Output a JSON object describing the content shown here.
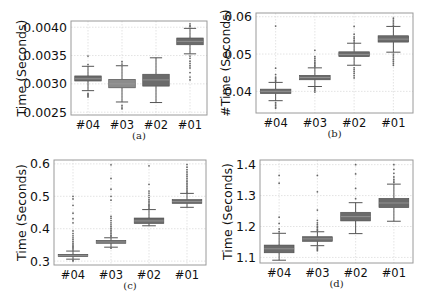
{
  "figure": {
    "panels": [
      {
        "id": "a",
        "caption": "(a)"
      },
      {
        "id": "b",
        "caption": "(b)"
      },
      {
        "id": "c",
        "caption": "(c)"
      },
      {
        "id": "d",
        "caption": "(d)"
      }
    ]
  },
  "colors": {
    "box_fill": "#6b6b6b",
    "box_fill_light": "#8c8c8c",
    "box_edge": "#4a4a4a",
    "median": "#9a9a9a",
    "whisker": "#555555",
    "flier": "#666666",
    "grid": "#dcdcdc",
    "frame": "#9a9a9a"
  },
  "chart_data": [
    {
      "type": "box",
      "panel": "a",
      "caption": "(a)",
      "title": "",
      "xlabel": "",
      "ylabel": "Time (Seconds)",
      "categories": [
        "#04",
        "#03",
        "#02",
        "#01"
      ],
      "ylim": [
        0.00245,
        0.00411
      ],
      "yticks": [
        0.0025,
        0.003,
        0.0035,
        0.004
      ],
      "ytick_labels": [
        "0.0025",
        "0.0030",
        "0.0035",
        "0.0040"
      ],
      "grid": true,
      "boxes": [
        {
          "label": "#04",
          "whislo": 0.00288,
          "q1": 0.00305,
          "med": 0.00309,
          "q3": 0.00314,
          "whishi": 0.00331,
          "fliers": [
            0.00277,
            0.00279,
            0.00281,
            0.00283,
            0.00334,
            0.00349
          ],
          "light": false
        },
        {
          "label": "#03",
          "whislo": 0.00268,
          "q1": 0.00293,
          "med": 0.003,
          "q3": 0.00308,
          "whishi": 0.00332,
          "fliers": [
            0.00256,
            0.00259,
            0.00262,
            0.00335,
            0.00339
          ],
          "light": true
        },
        {
          "label": "#02",
          "whislo": 0.00267,
          "q1": 0.00296,
          "med": 0.00307,
          "q3": 0.00317,
          "whishi": 0.00346,
          "fliers": [],
          "light": false
        },
        {
          "label": "#01",
          "whislo": 0.00353,
          "q1": 0.00369,
          "med": 0.00375,
          "q3": 0.00381,
          "whishi": 0.00398,
          "fliers": [
            0.00307,
            0.00312,
            0.0032,
            0.00328,
            0.00332,
            0.00336,
            0.0034,
            0.00345,
            0.00349,
            0.00401,
            0.00403,
            0.00406
          ],
          "light": false
        }
      ]
    },
    {
      "type": "box",
      "panel": "b",
      "caption": "(b)",
      "title": "",
      "xlabel": "",
      "ylabel": "#Time (Seconds)",
      "categories": [
        "#04",
        "#03",
        "#02",
        "#01"
      ],
      "ylim": [
        0.0342,
        0.061
      ],
      "yticks": [
        0.04,
        0.05,
        0.06
      ],
      "ytick_labels": [
        "0.04",
        "0.05",
        "0.06"
      ],
      "grid": true,
      "boxes": [
        {
          "label": "#04",
          "whislo": 0.0375,
          "q1": 0.0394,
          "med": 0.04,
          "q3": 0.0406,
          "whishi": 0.0424,
          "fliers": [
            0.0355,
            0.0358,
            0.0362,
            0.0366,
            0.037,
            0.0427,
            0.043,
            0.0434,
            0.0438,
            0.0445,
            0.0462,
            0.0575
          ],
          "light": false
        },
        {
          "label": "#03",
          "whislo": 0.0413,
          "q1": 0.0431,
          "med": 0.0437,
          "q3": 0.0443,
          "whishi": 0.0463,
          "fliers": [
            0.0398,
            0.0402,
            0.0406,
            0.0409,
            0.0466,
            0.047,
            0.0474,
            0.0478,
            0.0483,
            0.0488,
            0.0493,
            0.051
          ],
          "light": false
        },
        {
          "label": "#02",
          "whislo": 0.047,
          "q1": 0.0493,
          "med": 0.0499,
          "q3": 0.0506,
          "whishi": 0.0529,
          "fliers": [
            0.0436,
            0.0442,
            0.0448,
            0.0453,
            0.0458,
            0.0463,
            0.0532,
            0.0536,
            0.0541,
            0.0546,
            0.0553,
            0.0574
          ],
          "light": false
        },
        {
          "label": "#01",
          "whislo": 0.0505,
          "q1": 0.0532,
          "med": 0.054,
          "q3": 0.0549,
          "whishi": 0.0574,
          "fliers": [
            0.047,
            0.0475,
            0.048,
            0.0485,
            0.049,
            0.0495,
            0.05,
            0.0577,
            0.0581,
            0.0586,
            0.0591,
            0.0596
          ],
          "light": false
        }
      ]
    },
    {
      "type": "box",
      "panel": "c",
      "caption": "(c)",
      "title": "",
      "xlabel": "",
      "ylabel": "Time (Seconds)",
      "categories": [
        "#04",
        "#03",
        "#02",
        "#01"
      ],
      "ylim": [
        0.288,
        0.612
      ],
      "yticks": [
        0.3,
        0.4,
        0.5,
        0.6
      ],
      "ytick_labels": [
        "0.3",
        "0.4",
        "0.5",
        "0.6"
      ],
      "grid": true,
      "boxes": [
        {
          "label": "#04",
          "whislo": 0.306,
          "q1": 0.314,
          "med": 0.317,
          "q3": 0.321,
          "whishi": 0.331,
          "fliers": [
            0.3,
            0.303,
            0.334,
            0.338,
            0.342,
            0.346,
            0.35,
            0.355,
            0.36,
            0.366,
            0.372,
            0.378,
            0.385,
            0.393,
            0.418,
            0.431,
            0.448,
            0.472,
            0.492,
            0.5
          ],
          "light": false
        },
        {
          "label": "#03",
          "whislo": 0.343,
          "q1": 0.355,
          "med": 0.359,
          "q3": 0.364,
          "whishi": 0.372,
          "fliers": [
            0.34,
            0.376,
            0.38,
            0.385,
            0.39,
            0.395,
            0.4,
            0.406,
            0.412,
            0.418,
            0.425,
            0.432,
            0.438,
            0.488,
            0.5,
            0.522,
            0.555,
            0.597
          ],
          "light": false
        },
        {
          "label": "#02",
          "whislo": 0.409,
          "q1": 0.416,
          "med": 0.424,
          "q3": 0.433,
          "whishi": 0.459,
          "fliers": [
            0.463,
            0.467,
            0.471,
            0.475,
            0.48,
            0.485,
            0.49,
            0.496,
            0.503,
            0.51,
            0.516,
            0.537,
            0.594
          ],
          "light": false
        },
        {
          "label": "#01",
          "whislo": 0.466,
          "q1": 0.478,
          "med": 0.484,
          "q3": 0.49,
          "whishi": 0.509,
          "fliers": [
            0.512,
            0.516,
            0.52,
            0.525,
            0.53,
            0.535,
            0.54,
            0.545,
            0.55,
            0.556,
            0.562,
            0.568,
            0.575,
            0.582,
            0.59,
            0.598
          ],
          "light": false
        }
      ]
    },
    {
      "type": "box",
      "panel": "d",
      "caption": "(d)",
      "title": "",
      "xlabel": "",
      "ylabel": "Time (Seconds)",
      "categories": [
        "#04",
        "#03",
        "#02",
        "#01"
      ],
      "ylim": [
        1.082,
        1.415
      ],
      "yticks": [
        1.1,
        1.2,
        1.3,
        1.4
      ],
      "ytick_labels": [
        "1.1",
        "1.2",
        "1.3",
        "1.4"
      ],
      "grid": true,
      "boxes": [
        {
          "label": "#04",
          "whislo": 1.091,
          "q1": 1.115,
          "med": 1.128,
          "q3": 1.14,
          "whishi": 1.178,
          "fliers": [
            1.183,
            1.192,
            1.21,
            1.23,
            1.34,
            1.365
          ],
          "light": false
        },
        {
          "label": "#03",
          "whislo": 1.138,
          "q1": 1.152,
          "med": 1.16,
          "q3": 1.167,
          "whishi": 1.183,
          "fliers": [
            1.122,
            1.126,
            1.13,
            1.134,
            1.187,
            1.191,
            1.196,
            1.2,
            1.206,
            1.212,
            1.22,
            1.253,
            1.312,
            1.365
          ],
          "light": false
        },
        {
          "label": "#02",
          "whislo": 1.177,
          "q1": 1.218,
          "med": 1.232,
          "q3": 1.246,
          "whishi": 1.277,
          "fliers": [
            1.29,
            1.323,
            1.37,
            1.4
          ],
          "light": false
        },
        {
          "label": "#01",
          "whislo": 1.217,
          "q1": 1.261,
          "med": 1.276,
          "q3": 1.291,
          "whishi": 1.337,
          "fliers": [
            1.342,
            1.347,
            1.352,
            1.36,
            1.372,
            1.385,
            1.4
          ],
          "light": false
        }
      ]
    }
  ]
}
